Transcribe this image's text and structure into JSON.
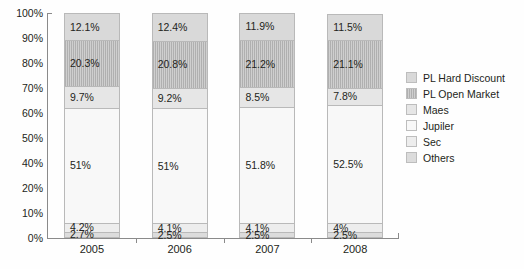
{
  "chart_data": {
    "type": "bar",
    "stacked": true,
    "stack_mode": "percent",
    "title": "",
    "subtitle": "",
    "xlabel": "",
    "ylabel": "",
    "grid": false,
    "legend_position": "right",
    "ylim": [
      0,
      100
    ],
    "categories": [
      "2005",
      "2006",
      "2007",
      "2008"
    ],
    "y_tick_labels": [
      "100%",
      "90%",
      "80%",
      "70%",
      "60%",
      "50%",
      "40%",
      "20%",
      "10%",
      "0%"
    ],
    "series": [
      {
        "name": "PL Hard Discount",
        "color": "#d9d9d9",
        "values": [
          12.1,
          12.4,
          11.9,
          11.5
        ],
        "labels": [
          "12.1%",
          "12.4%",
          "11.9%",
          "11.5%"
        ]
      },
      {
        "name": "PL Open Market",
        "color": "#cfcfcf",
        "values": [
          20.3,
          20.8,
          21.2,
          21.1
        ],
        "labels": [
          "20.3%",
          "20.8%",
          "21.2%",
          "21.1%"
        ]
      },
      {
        "name": "Maes",
        "color": "#e6e6e6",
        "values": [
          9.7,
          9.2,
          8.5,
          7.8
        ],
        "labels": [
          "9.7%",
          "9.2%",
          "8.5%",
          "7.8%"
        ]
      },
      {
        "name": "Jupiler",
        "color": "#f8f8f8",
        "values": [
          51.0,
          51.0,
          51.8,
          52.5
        ],
        "labels": [
          "51%",
          "51%",
          "51.8%",
          "52.5%"
        ]
      },
      {
        "name": "Sec",
        "color": "#ededed",
        "values": [
          4.2,
          4.1,
          4.1,
          4.0
        ],
        "labels": [
          "4.2%",
          "4.1%",
          "4.1%",
          "4%"
        ]
      },
      {
        "name": "Others",
        "color": "#dcdcdc",
        "values": [
          2.7,
          2.5,
          2.5,
          2.5
        ],
        "labels": [
          "2.7%",
          "2.5%",
          "2.5%",
          "2.5%"
        ]
      }
    ]
  },
  "legend": {
    "items": [
      {
        "label": "PL Hard Discount"
      },
      {
        "label": "PL Open Market"
      },
      {
        "label": "Maes"
      },
      {
        "label": "Jupiler"
      },
      {
        "label": "Sec"
      },
      {
        "label": "Others"
      }
    ]
  }
}
